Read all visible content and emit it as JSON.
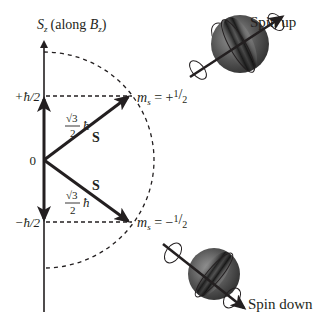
{
  "figure": {
    "axis_label": "S",
    "axis_label_sub": "z",
    "axis_label_paren": "(along ",
    "axis_label_B": "B",
    "axis_label_B_sub": "z",
    "axis_label_close": ")",
    "tick_plus": "+ħ/2",
    "tick_zero": "0",
    "tick_minus": "−ħ/2",
    "magnitude_sqrt": "√3",
    "magnitude_den": "2",
    "magnitude_hbar": "ħ",
    "vector_label_upper": "S",
    "vector_label_lower": "S",
    "ms_upper_m": "m",
    "ms_upper_sub": "s",
    "ms_upper_eq": " = +",
    "ms_upper_num": "1",
    "ms_upper_den": "2",
    "ms_lower_m": "m",
    "ms_lower_sub": "s",
    "ms_lower_eq": " = −",
    "ms_lower_num": "1",
    "ms_lower_den": "2",
    "spin_up_label": "Spin up",
    "spin_down_label": "Spin down"
  },
  "colors": {
    "ink": "#231f20",
    "sphere_dark": "#1a1a1a",
    "sphere_light": "#b5b5b5"
  }
}
